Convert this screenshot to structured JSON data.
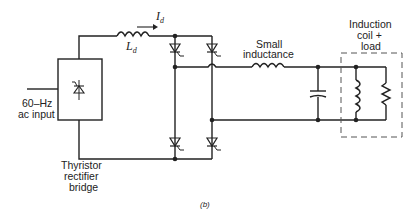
{
  "diagram": {
    "labels": {
      "current": "I",
      "current_sub": "d",
      "inductor": "L",
      "inductor_sub": "d",
      "small_inductance_1": "Small",
      "small_inductance_2": "inductance",
      "load_1": "Induction",
      "load_2": "coil  +",
      "load_3": "load",
      "ac_1": "60–Hz",
      "ac_2": "ac input",
      "bridge_1": "Thyristor",
      "bridge_2": "rectifier",
      "bridge_3": "bridge",
      "caption": "(b)"
    },
    "colors": {
      "wire": "#222222",
      "dashed": "#555555"
    }
  }
}
